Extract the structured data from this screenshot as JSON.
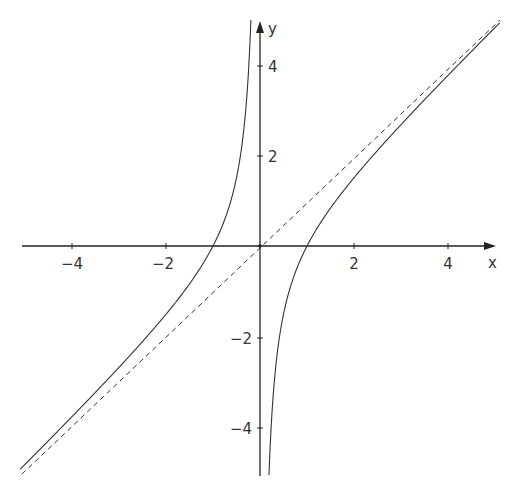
{
  "chart_data": {
    "type": "line",
    "title": "",
    "xlabel": "x",
    "ylabel": "y",
    "xlim": [
      -5.2,
      5.0
    ],
    "ylim": [
      -5.2,
      5.0
    ],
    "grid": false,
    "legend": null,
    "x_ticks": [
      -4,
      -2,
      2,
      4
    ],
    "y_ticks": [
      4,
      2,
      -2,
      -4
    ],
    "x_tick_labels": [
      "−4",
      "−2",
      "2",
      "4"
    ],
    "y_tick_labels": [
      "4",
      "2",
      "−2",
      "−4"
    ],
    "series": [
      {
        "name": "y = x - 1/x",
        "style": "solid",
        "branches": "two branches, vertical asymptote x=0, zeros at x=-1 and x=1"
      },
      {
        "name": "y = x",
        "style": "dashed",
        "role": "oblique asymptote"
      }
    ]
  },
  "axes": {
    "x_label": "x",
    "y_label": "y"
  }
}
